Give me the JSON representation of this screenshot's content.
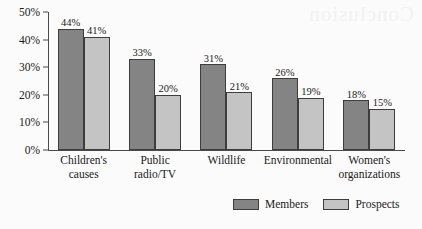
{
  "chart_data": {
    "type": "bar",
    "title": "",
    "subtitle": "",
    "xlabel": "",
    "ylabel": "",
    "ylim": [
      0,
      50
    ],
    "grid": false,
    "legend_position": "bottom",
    "y_ticks": [
      "0%",
      "10%",
      "20%",
      "30%",
      "40%",
      "50%"
    ],
    "y_tick_values": [
      0,
      10,
      20,
      30,
      40,
      50
    ],
    "categories": [
      "Children's\ncauses",
      "Public\nradio/TV",
      "Wildlife",
      "Environmental",
      "Women's\norganizations"
    ],
    "category_lines": [
      [
        "Children's",
        "causes"
      ],
      [
        "Public",
        "radio/TV"
      ],
      [
        "Wildlife"
      ],
      [
        "Environmental"
      ],
      [
        "Women's",
        "organizations"
      ]
    ],
    "series": [
      {
        "name": "Members",
        "color": "#848484",
        "values": [
          44,
          33,
          31,
          26,
          18
        ],
        "labels": [
          "44%",
          "33%",
          "31%",
          "26%",
          "18%"
        ]
      },
      {
        "name": "Prospects",
        "color": "#c4c4c4",
        "values": [
          41,
          20,
          21,
          19,
          15
        ],
        "labels": [
          "41%",
          "20%",
          "21%",
          "19%",
          "15%"
        ]
      }
    ]
  },
  "legend": {
    "items": [
      {
        "label": "Members",
        "color": "#848484"
      },
      {
        "label": "Prospects",
        "color": "#c4c4c4"
      }
    ]
  },
  "artifacts": {
    "bleed_through_text": "Conclusion"
  }
}
